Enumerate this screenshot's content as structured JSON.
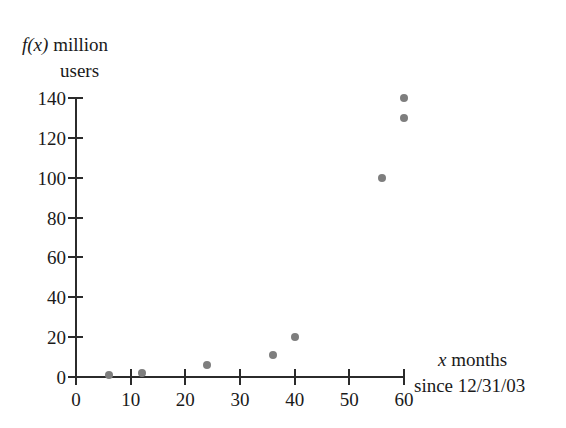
{
  "chart_data": {
    "type": "scatter",
    "title": "",
    "ylabel": "f(x) million users",
    "ylabel_line1_prefix": "f(x)",
    "ylabel_line1_rest": " million",
    "ylabel_line2": "users",
    "xlabel": "x months since 12/31/03",
    "xlabel_line1_prefix": "x",
    "xlabel_line1_rest": " months",
    "xlabel_line2": "since 12/31/03",
    "xlim": [
      0,
      60
    ],
    "ylim": [
      0,
      140
    ],
    "xticks": [
      0,
      10,
      20,
      30,
      40,
      50,
      60
    ],
    "yticks": [
      0,
      20,
      40,
      60,
      80,
      100,
      120,
      140
    ],
    "xtick_labels": [
      "0",
      "10",
      "20",
      "30",
      "40",
      "50",
      "60"
    ],
    "ytick_labels": [
      "0",
      "20",
      "40",
      "60",
      "80",
      "100",
      "120",
      "140"
    ],
    "grid": false,
    "legend": null,
    "marker_color": "#7e7e7e",
    "axis_color": "#2b2b2b",
    "points": [
      {
        "x": 6,
        "y": 1
      },
      {
        "x": 12,
        "y": 2
      },
      {
        "x": 24,
        "y": 6
      },
      {
        "x": 36,
        "y": 11
      },
      {
        "x": 40,
        "y": 20
      },
      {
        "x": 56,
        "y": 100
      },
      {
        "x": 60,
        "y": 130
      },
      {
        "x": 60,
        "y": 140
      }
    ],
    "x": [
      6,
      12,
      24,
      36,
      40,
      56,
      60,
      60
    ],
    "values": [
      1,
      2,
      6,
      11,
      20,
      100,
      130,
      140
    ]
  }
}
